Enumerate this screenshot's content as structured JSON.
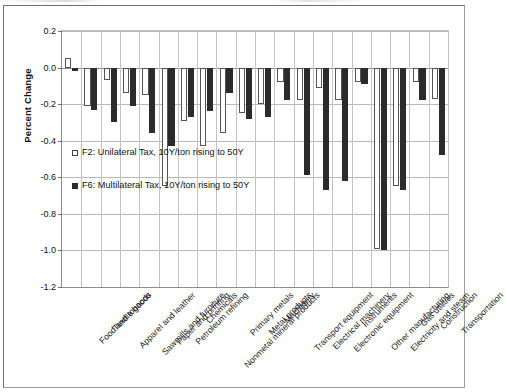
{
  "chart_data": {
    "type": "bar",
    "title": "",
    "xlabel": "",
    "ylabel": "Percent Change",
    "ylim": [
      -1.2,
      0.2
    ],
    "ytick_labels": [
      "0.2",
      "0.0",
      "-0.2",
      "-0.4",
      "-0.6",
      "-0.8",
      "-1.0",
      "-1.2"
    ],
    "ytick_values": [
      0.2,
      0.0,
      -0.2,
      -0.4,
      -0.6,
      -0.8,
      -1.0,
      -1.2
    ],
    "grid": true,
    "legend_position": "inside-left",
    "categories": [
      "Food and tobacco",
      "Textile goods",
      "Apparel and leather",
      "Sawmills and furniture",
      "Paper and printing",
      "Petroleum refining",
      "Chemicals",
      "Nonmetal mineral products",
      "Primary metals",
      "Metal products",
      "Machinery",
      "Transport equipment",
      "Electrical machinery",
      "Electronic equipment",
      "Instruments",
      "Other manufacturing",
      "Electricity and steam",
      "Gas utilities",
      "Construction",
      "Transportation"
    ],
    "series": [
      {
        "name": "F2: Unilateral Tax, 10Y/ton rising to 50Y",
        "style": "open",
        "color": "#ffffff",
        "edge_color": "#555555",
        "values": [
          0.05,
          -0.21,
          -0.07,
          -0.14,
          -0.15,
          -0.65,
          -0.29,
          -0.43,
          -0.36,
          -0.25,
          -0.2,
          -0.08,
          -0.18,
          -0.11,
          -0.18,
          -0.08,
          -0.99,
          -0.65,
          -0.08,
          -0.17
        ]
      },
      {
        "name": "F6: Multilateral Tax, 10Y/ton rising to 50Y",
        "style": "filled",
        "color": "#2b2b2b",
        "edge_color": "#2b2b2b",
        "values": [
          -0.02,
          -0.23,
          -0.3,
          -0.21,
          -0.36,
          -0.43,
          -0.27,
          -0.24,
          -0.14,
          -0.28,
          -0.27,
          -0.18,
          -0.59,
          -0.67,
          -0.62,
          -0.09,
          -1.0,
          -0.67,
          -0.18,
          -0.48
        ]
      }
    ]
  },
  "legend": {
    "items": [
      {
        "label": "F2: Unilateral Tax, 10Y/ton rising to 50Y",
        "swatch": "open-square-icon"
      },
      {
        "label": "F6: Multilateral Tax, 10Y/ton rising to 50Y",
        "swatch": "filled-square-icon"
      }
    ]
  }
}
